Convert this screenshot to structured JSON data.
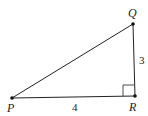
{
  "diagram": {
    "type": "right-triangle",
    "vertices": [
      {
        "name": "P",
        "x": 12,
        "y": 98
      },
      {
        "name": "Q",
        "x": 133,
        "y": 24
      },
      {
        "name": "R",
        "x": 135,
        "y": 96
      }
    ],
    "labels": {
      "P": "P",
      "Q": "Q",
      "R": "R"
    },
    "side_lengths": {
      "QR": "3",
      "PR": "4"
    },
    "right_angle_at": "R",
    "colors": {
      "stroke": "#222222",
      "background": "#ffffff"
    }
  }
}
